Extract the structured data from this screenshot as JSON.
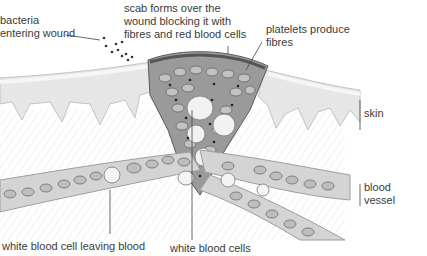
{
  "diagram": {
    "colors": {
      "background": "#ffffff",
      "skin_fill": "#e8e8e8",
      "skin_edge": "#bdbdbd",
      "scab_fill": "#8c8c8c",
      "red_cell": "#b5b5b5",
      "white_cell": "#f4f4f4",
      "vessel_fill": "#cfcfcf",
      "line": "#444444",
      "text": "#3a3a3a"
    },
    "labels": {
      "bacteria": [
        "bacteria",
        "entering wound"
      ],
      "scab": [
        "scab forms over the",
        "wound blocking it with",
        "fibres and red blood cells"
      ],
      "platelets": [
        "platelets produce",
        "fibres"
      ],
      "skin": "skin",
      "blood_vessel": [
        "blood",
        "vessel"
      ],
      "white_cell_leaving": "white blood cell leaving blood",
      "white_cells": "white blood cells"
    }
  }
}
